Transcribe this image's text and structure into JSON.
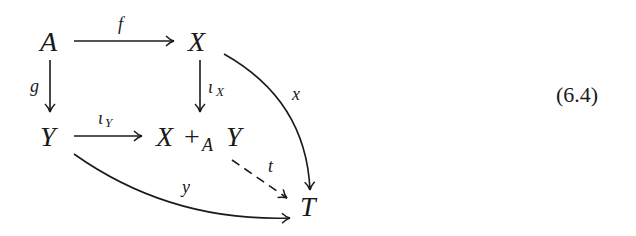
{
  "diagram": {
    "type": "commutative-diagram",
    "nodes": {
      "A": "A",
      "X": "X",
      "Y": "Y",
      "pushout_X": "X",
      "pushout_plus": "+",
      "pushout_sub": "A",
      "pushout_Y": "Y",
      "T": "T"
    },
    "arrows": {
      "f": "f",
      "g": "g",
      "iota_X": "ι",
      "iota_X_sub": "X",
      "iota_Y": "ι",
      "iota_Y_sub": "Y",
      "x": "x",
      "y": "y",
      "t": "t"
    },
    "equation_number": "(6.4)"
  }
}
